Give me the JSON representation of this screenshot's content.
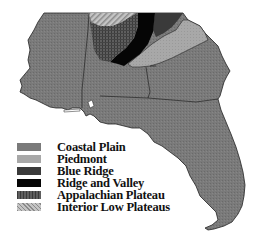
{
  "map": {
    "title": "",
    "region": "Southeastern United States",
    "states_depicted": [
      "Mississippi",
      "Alabama",
      "Georgia",
      "Florida",
      "Tennessee (partial)",
      "South Carolina (partial)"
    ],
    "colors": {
      "coastal_plain": "#7a7a7a",
      "piedmont": "#a8a8a8",
      "blue_ridge": "#3a3a3a",
      "ridge_and_valley": "#050505",
      "appalachian_plateau": "#555555",
      "interior_low_plateaus": "#b4b4b4",
      "border": "#222222",
      "background": "#ffffff"
    }
  },
  "legend": {
    "items": [
      {
        "label": "Coastal Plain",
        "color": "#7a7a7a",
        "pattern": "stipple"
      },
      {
        "label": "Piedmont",
        "color": "#a8a8a8",
        "pattern": "stipple"
      },
      {
        "label": "Blue Ridge",
        "color": "#3a3a3a",
        "pattern": "solid"
      },
      {
        "label": "Ridge and Valley",
        "color": "#050505",
        "pattern": "solid"
      },
      {
        "label": "Appalachian Plateau",
        "color": "#555555",
        "pattern": "crosshatch"
      },
      {
        "label": "Interior Low Plateaus",
        "color": "#b4b4b4",
        "pattern": "diagonal-hatch"
      }
    ]
  }
}
